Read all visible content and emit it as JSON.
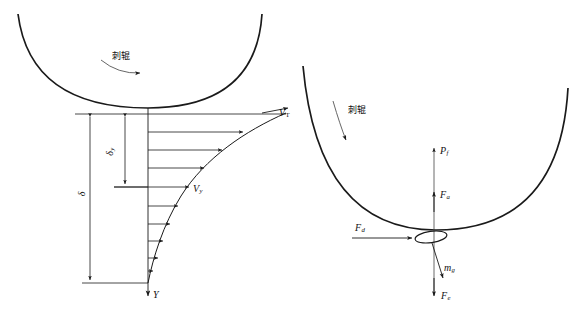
{
  "figure": {
    "title_left": "",
    "title_right": "",
    "background": "#ffffff",
    "stroke": "#1a1a1a"
  },
  "left_diagram": {
    "name": "velocity-boundary-layer-diagram",
    "roller_label": "刺辊",
    "rotation_arrow": "curved-arrow-clockwise",
    "axis_label": "Y",
    "velocity_surface_label": "V",
    "velocity_surface_sub": "T",
    "velocity_local_label": "V",
    "velocity_local_sub": "y",
    "dim_inner_label": "δ",
    "dim_inner_sub": "y",
    "dim_outer_label": "δ",
    "profile_arrow_count": 9
  },
  "right_diagram": {
    "name": "fiber-force-balance-diagram",
    "roller_label": "刺辊",
    "rotation_arrow": "curved-arrow-clockwise",
    "forces": [
      {
        "symbol": "P",
        "sub": "f",
        "direction": "up",
        "name": "force-pf"
      },
      {
        "symbol": "F",
        "sub": "a",
        "direction": "up",
        "name": "force-fa"
      },
      {
        "symbol": "F",
        "sub": "d",
        "direction": "right",
        "name": "force-fd"
      },
      {
        "symbol": "m",
        "sub": "g",
        "direction": "down",
        "name": "force-mg"
      },
      {
        "symbol": "F",
        "sub": "e",
        "direction": "down",
        "name": "force-fe"
      }
    ],
    "fiber_shape": "ellipse"
  },
  "captions": {
    "left": "",
    "right": ""
  }
}
